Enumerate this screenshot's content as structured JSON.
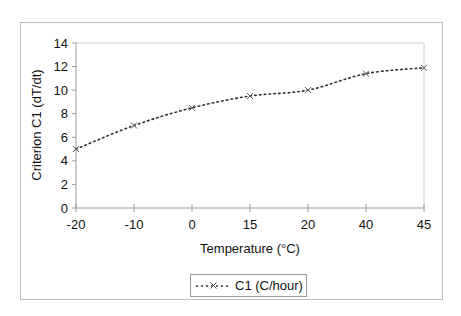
{
  "chart_data": {
    "type": "line",
    "title": "",
    "xlabel": "Temperature (°C)",
    "ylabel": "Criterion C1 (dT/dt)",
    "categories": [
      "-20",
      "-10",
      "0",
      "15",
      "20",
      "40",
      "45"
    ],
    "series": [
      {
        "name": "C1 (C/hour)",
        "values": [
          5.0,
          7.0,
          8.5,
          9.5,
          10.0,
          11.4,
          11.9
        ],
        "line_style": "dotted",
        "marker": "x",
        "color": "#333333"
      }
    ],
    "ylim": [
      0,
      14
    ],
    "yticks": [
      0,
      2,
      4,
      6,
      8,
      10,
      12,
      14
    ],
    "grid": false,
    "legend_position": "bottom",
    "x_axis_type": "category"
  },
  "legend": {
    "label": "C1 (C/hour)"
  },
  "axes": {
    "xlabel": "Temperature (°C)",
    "ylabel": "Criterion C1 (dT/dt)"
  }
}
